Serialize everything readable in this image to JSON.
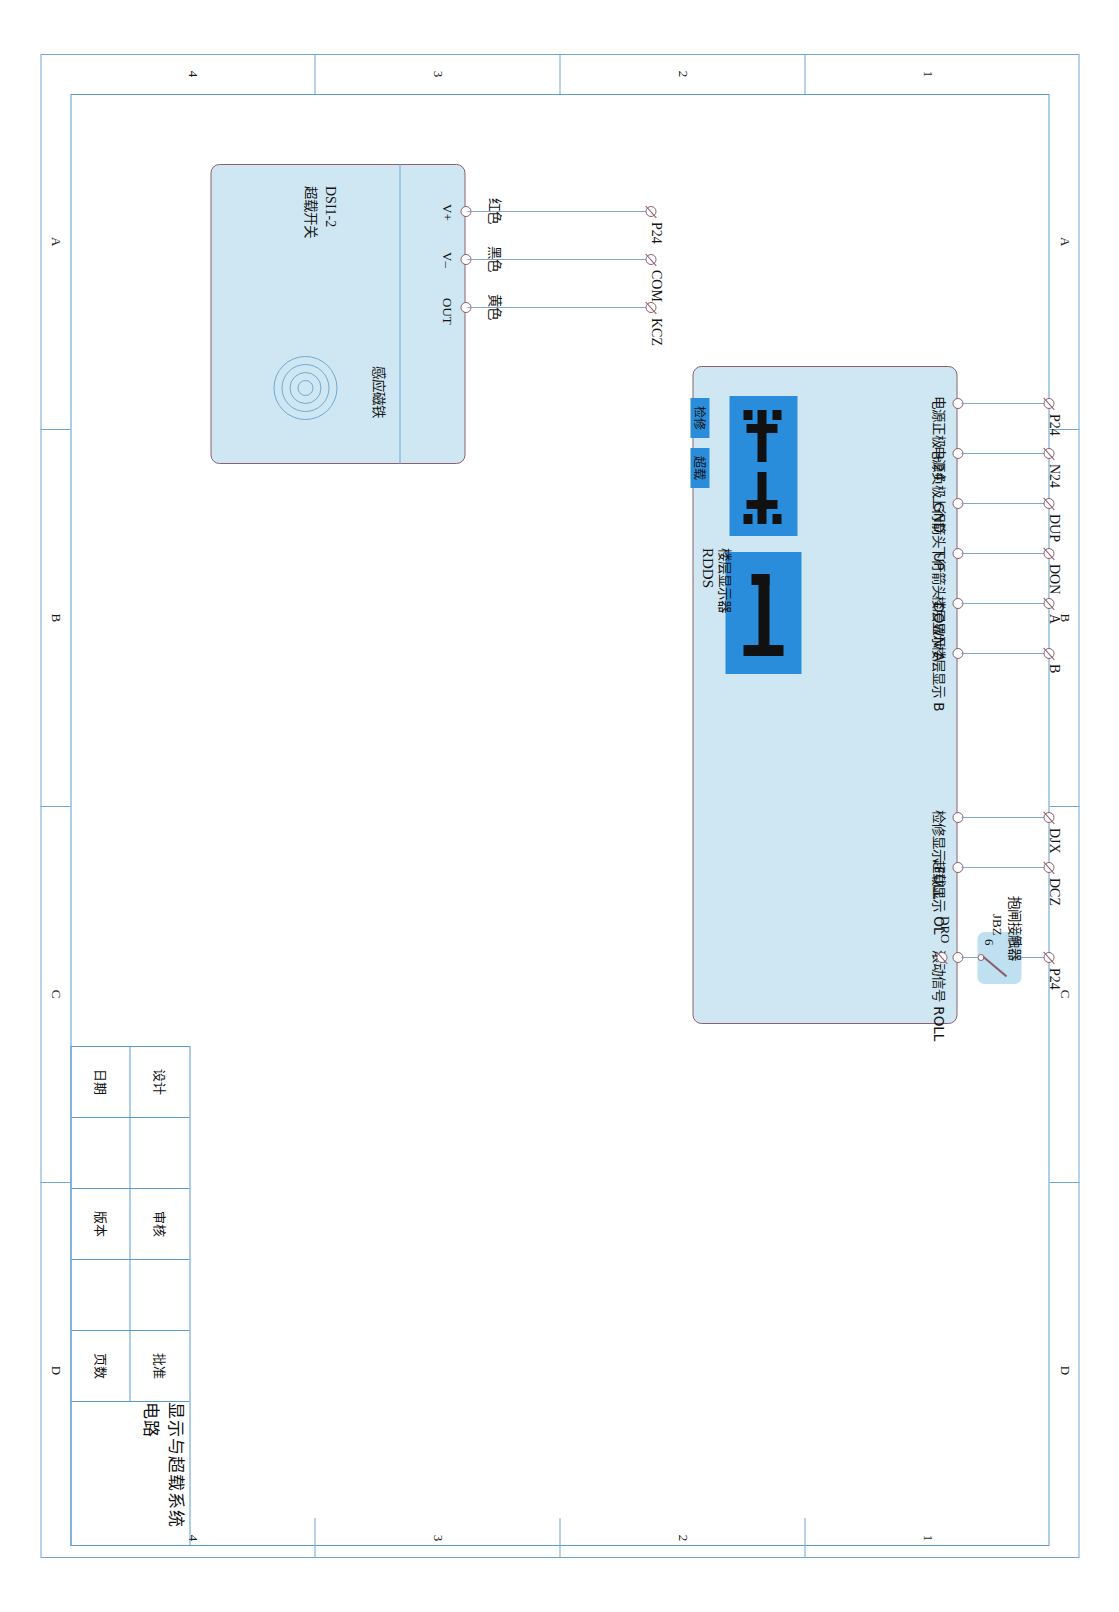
{
  "sheet": {
    "zones_horizontal": [
      "A",
      "B",
      "C",
      "D"
    ],
    "zones_vertical": [
      "1",
      "2",
      "3",
      "4"
    ]
  },
  "title_block": {
    "drawing_title": "显示与超载系统电路",
    "fields": [
      {
        "label": "设计",
        "value": ""
      },
      {
        "label": "日期",
        "value": ""
      },
      {
        "label": "审核",
        "value": ""
      },
      {
        "label": "版本",
        "value": ""
      },
      {
        "label": "批准",
        "value": ""
      },
      {
        "label": "页数",
        "value": ""
      }
    ]
  },
  "rdds_unit": {
    "name": "RDDS",
    "subtitle": "楼层显示器",
    "digit_display": "1",
    "arrow_tile": "up-down-arrows",
    "badges": [
      {
        "name": "inspection",
        "label": "检修"
      },
      {
        "name": "overload",
        "label": "超载"
      }
    ],
    "terminals": [
      {
        "cn": "电源正极 +24",
        "signal": "P24"
      },
      {
        "cn": "电源负极 GND",
        "signal": "N24"
      },
      {
        "cn": "上行箭头 UP",
        "signal": "DUP"
      },
      {
        "cn": "下行箭头 DOWN",
        "signal": "DON"
      },
      {
        "cn": "楼层显示 A",
        "signal": "A"
      },
      {
        "cn": "楼层显示 B",
        "signal": "B"
      },
      {
        "cn": "检修显示 FULL",
        "signal": "DJX"
      },
      {
        "cn": "超载显示 OL",
        "signal": "DCZ"
      },
      {
        "cn": "滚动信号 ROLL",
        "signal": "P24"
      }
    ]
  },
  "contactor": {
    "cn_name": "抱闸接触器",
    "code": "JBZ",
    "pin_left": "6",
    "pin_right": "5",
    "node_label": "DRO"
  },
  "overload_switch": {
    "model": "DSI1-2",
    "cn_name": "超载开关",
    "magnet_label": "感应磁铁",
    "terminals": [
      {
        "pin": "V+",
        "wire_color": "红色",
        "signal": "P24"
      },
      {
        "pin": "V–",
        "wire_color": "黑色",
        "signal": "COM"
      },
      {
        "pin": "OUT",
        "wire_color": "黄色",
        "signal": "KCZ"
      }
    ]
  },
  "colors": {
    "panel_fill": "#cfe7f3",
    "panel_border": "#8d5f6d",
    "frame_line": "#6fa8d6",
    "wire": "#7fa8cc",
    "segment_blue": "#2a8ddb"
  }
}
